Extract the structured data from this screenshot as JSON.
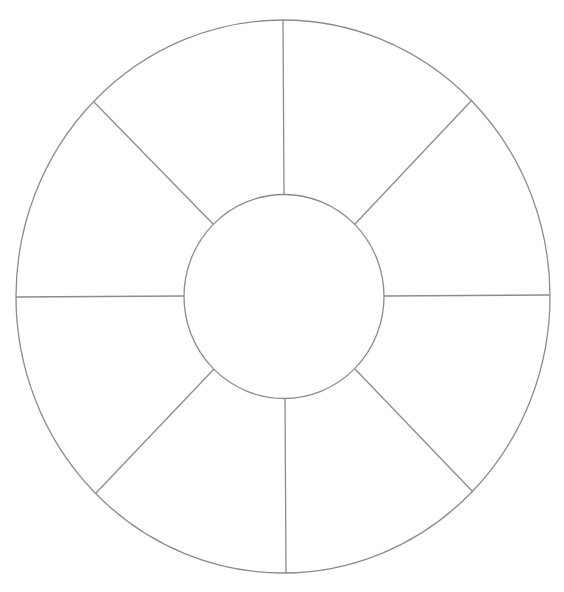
{
  "diagram": {
    "type": "segmented-wheel",
    "segments": 8,
    "line_color": "#8c8c8c",
    "background": "#ffffff",
    "outer_circle": {
      "cx": 283,
      "cy": 296.5,
      "rx": 267,
      "ry": 276.5
    },
    "inner_circle": {
      "cx": 284,
      "cy": 296.5,
      "rx": 100,
      "ry": 102
    },
    "spokes": [
      {
        "name": "top",
        "x1": 283,
        "y1": 20,
        "x2": 284,
        "y2": 194.5
      },
      {
        "name": "upper-right",
        "x1": 472,
        "y1": 100,
        "x2": 355,
        "y2": 224
      },
      {
        "name": "right",
        "x1": 550,
        "y1": 295,
        "x2": 384,
        "y2": 296
      },
      {
        "name": "lower-right",
        "x1": 473,
        "y1": 492,
        "x2": 355,
        "y2": 369
      },
      {
        "name": "bottom",
        "x1": 286,
        "y1": 573,
        "x2": 285,
        "y2": 398.5
      },
      {
        "name": "lower-left",
        "x1": 96,
        "y1": 493,
        "x2": 214,
        "y2": 369
      },
      {
        "name": "left",
        "x1": 16,
        "y1": 297,
        "x2": 184,
        "y2": 296
      },
      {
        "name": "upper-left",
        "x1": 94,
        "y1": 102,
        "x2": 213,
        "y2": 224
      }
    ],
    "labels": []
  }
}
